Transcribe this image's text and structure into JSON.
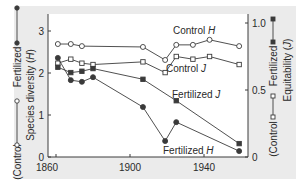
{
  "chart_data": {
    "type": "line",
    "title": "",
    "xlabel": "",
    "ylabel_left": "Species diversity (H)",
    "ylabel_right": "Equitability (J)",
    "xlim": [
      1855,
      1963
    ],
    "ylim_left": [
      0,
      3.2
    ],
    "ylim_right": [
      0,
      1.0
    ],
    "x_ticks": [
      1860,
      1900,
      1940
    ],
    "y_ticks_left": [
      0,
      1,
      2,
      3
    ],
    "y_ticks_right": [
      0,
      0.5,
      1.0
    ],
    "y_tick_labels_right": [
      "0",
      "0.5",
      "1.0"
    ],
    "grid": false,
    "legend_left": {
      "control_label": "Control",
      "fertilized_label": "Fertilized",
      "axis_label": "Species diversity",
      "axis_symbol": "H"
    },
    "legend_right": {
      "control_label": "Control",
      "fertilized_label": "Fertilized",
      "axis_label": "Equitability",
      "axis_symbol": "J"
    },
    "series": [
      {
        "name": "Control H",
        "label_text": "Control",
        "label_symbol": "H",
        "axis": "left",
        "marker": "open-circle",
        "x": [
          1861,
          1868,
          1874,
          1907,
          1919,
          1925,
          1934,
          1943,
          1959
        ],
        "values": [
          2.69,
          2.69,
          2.64,
          2.62,
          2.31,
          2.67,
          2.67,
          2.79,
          2.64
        ]
      },
      {
        "name": "Control J",
        "label_text": "Control",
        "label_symbol": "J",
        "axis": "right",
        "marker": "open-square",
        "x": [
          1861,
          1868,
          1874,
          1880,
          1907,
          1919,
          1925,
          1934,
          1943,
          1959
        ],
        "values": [
          0.7,
          0.73,
          0.7,
          0.69,
          0.71,
          0.63,
          0.75,
          0.73,
          0.75,
          0.69
        ]
      },
      {
        "name": "Fertilized J",
        "label_text": "Fertilized",
        "label_symbol": "J",
        "axis": "right",
        "marker": "filled-square",
        "x": [
          1861,
          1868,
          1874,
          1880,
          1907,
          1925,
          1959
        ],
        "values": [
          0.67,
          0.63,
          0.64,
          0.66,
          0.58,
          0.42,
          0.1
        ]
      },
      {
        "name": "Fertilized H",
        "label_text": "Fertilized",
        "label_symbol": "H",
        "axis": "left",
        "marker": "filled-circle",
        "x": [
          1861,
          1868,
          1874,
          1880,
          1907,
          1919,
          1925,
          1959
        ],
        "values": [
          2.36,
          1.83,
          1.79,
          1.9,
          1.19,
          0.38,
          0.83,
          0.14
        ]
      }
    ],
    "annotations": [
      {
        "text": "Control",
        "symbol": "H",
        "x": 1927,
        "y_left": 2.95
      },
      {
        "text": "Control",
        "symbol": "J",
        "x": 1921,
        "y_left": 2.14
      },
      {
        "text": "Fertilized",
        "symbol": "J",
        "x": 1908,
        "y_left": 1.32
      },
      {
        "text": "Fertilized",
        "symbol": "H",
        "x": 1903,
        "y_left": 0.0
      }
    ]
  },
  "colors": {
    "background": "#ebebeb",
    "plot_area": "#ffffff",
    "line": "#3c3c3c",
    "text": "#2a2a2a"
  }
}
